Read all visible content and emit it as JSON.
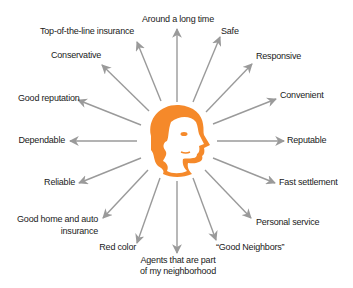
{
  "diagram": {
    "type": "radial",
    "center": {
      "icon": "head-profile-icon",
      "color": "#f5892a"
    },
    "arrow_color": "#9a9a9a",
    "labels": {
      "around": "Around a long time",
      "safe": "Safe",
      "responsive": "Responsive",
      "convenient": "Convenient",
      "reputable": "Reputable",
      "fast": "Fast settlement",
      "personal": "Personal service",
      "neighbors": "“Good Neighbors”",
      "agents_1": "Agents that are part",
      "agents_2": "of my neighborhood",
      "red": "Red color",
      "home_1": "Good home and auto",
      "home_2": "insurance",
      "reliable": "Reliable",
      "dependable": "Dependable",
      "reputation": "Good reputation",
      "conservative": "Conservative",
      "topline": "Top-of-the-line insurance"
    }
  }
}
